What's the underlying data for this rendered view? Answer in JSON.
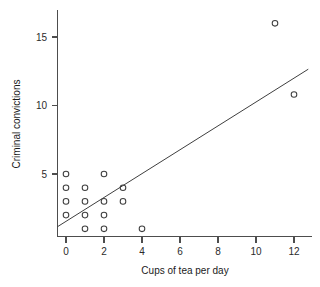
{
  "chart_data": {
    "type": "scatter",
    "title": "",
    "xlabel": "Cups of tea per day",
    "ylabel": "Criminal convictions",
    "xlim": [
      -0.5,
      12.8
    ],
    "ylim": [
      0.4,
      16.8
    ],
    "xticks": [
      0,
      2,
      4,
      6,
      8,
      10,
      12
    ],
    "xticklabels": [
      "0",
      "2",
      "4",
      "6",
      "8",
      "10",
      "12"
    ],
    "yticks": [
      5,
      10,
      15
    ],
    "yticklabels": [
      "5",
      "10",
      "15"
    ],
    "grid": false,
    "legend": null,
    "marker": "open-circle",
    "points": [
      {
        "x": 0,
        "y": 5
      },
      {
        "x": 0,
        "y": 4
      },
      {
        "x": 0,
        "y": 3
      },
      {
        "x": 0,
        "y": 2
      },
      {
        "x": 1,
        "y": 4
      },
      {
        "x": 1,
        "y": 3
      },
      {
        "x": 1,
        "y": 2
      },
      {
        "x": 1,
        "y": 1
      },
      {
        "x": 2,
        "y": 5
      },
      {
        "x": 2,
        "y": 3
      },
      {
        "x": 2,
        "y": 2
      },
      {
        "x": 2,
        "y": 1
      },
      {
        "x": 3,
        "y": 4
      },
      {
        "x": 3,
        "y": 3
      },
      {
        "x": 4,
        "y": 1
      },
      {
        "x": 11,
        "y": 16
      },
      {
        "x": 12,
        "y": 10.8
      }
    ],
    "series": [
      {
        "name": "observations",
        "x": [
          0,
          0,
          0,
          0,
          1,
          1,
          1,
          1,
          2,
          2,
          2,
          2,
          3,
          3,
          4,
          11,
          12
        ],
        "values": [
          5,
          4,
          3,
          2,
          4,
          3,
          2,
          1,
          5,
          3,
          2,
          1,
          4,
          3,
          1,
          16,
          10.8
        ]
      }
    ],
    "fit_line": {
      "name": "regression-line",
      "x_start": -0.45,
      "y_start": 1.15,
      "x_end": 12.75,
      "y_end": 12.65
    },
    "colors": {
      "marker_stroke": "#3f3f3f",
      "line": "#3f3f3f",
      "axis": "#4d4d4d",
      "text": "#1a1a1a",
      "background": "#ffffff"
    }
  }
}
